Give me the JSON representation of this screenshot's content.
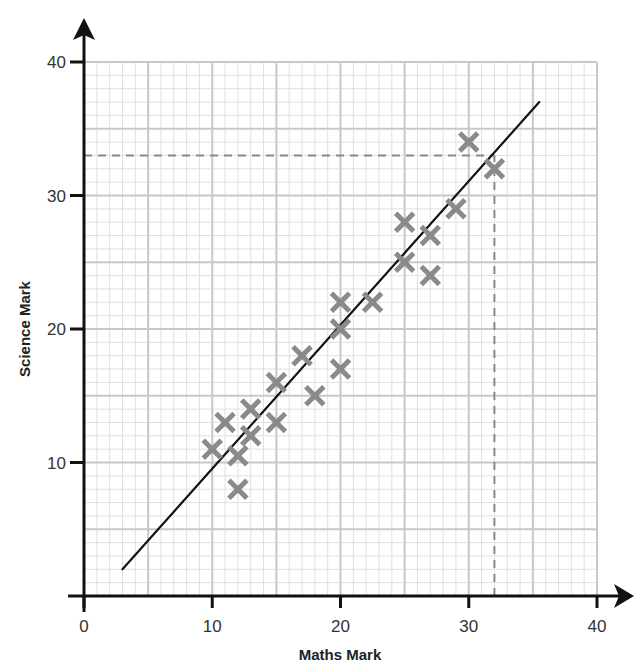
{
  "chart_data": {
    "type": "scatter",
    "title": "",
    "xlabel": "Maths Mark",
    "ylabel": "Science Mark",
    "xlim": [
      0,
      40
    ],
    "ylim": [
      0,
      40
    ],
    "x_ticks": [
      0,
      10,
      20,
      30,
      40
    ],
    "y_ticks": [
      10,
      20,
      30,
      40
    ],
    "x_tick_labels": [
      "0",
      "10",
      "20",
      "30",
      "40"
    ],
    "y_tick_labels": [
      "10",
      "20",
      "30",
      "40"
    ],
    "grid": {
      "major_step": 5,
      "minor_step": 1,
      "on": true
    },
    "legend": null,
    "marker": "x",
    "series": [
      {
        "name": "Students",
        "points": [
          [
            10,
            11
          ],
          [
            11,
            13
          ],
          [
            12,
            10.5
          ],
          [
            12,
            8
          ],
          [
            13,
            14
          ],
          [
            13,
            12
          ],
          [
            15,
            16
          ],
          [
            15,
            13
          ],
          [
            17,
            18
          ],
          [
            18,
            15
          ],
          [
            20,
            22
          ],
          [
            20,
            20
          ],
          [
            20,
            17
          ],
          [
            22.5,
            22
          ],
          [
            25,
            28
          ],
          [
            25,
            25
          ],
          [
            27,
            27
          ],
          [
            27,
            24
          ],
          [
            29,
            29
          ],
          [
            30,
            34
          ],
          [
            32,
            32
          ]
        ]
      }
    ],
    "line_of_best_fit": {
      "from": [
        3,
        2
      ],
      "to": [
        35.5,
        37
      ]
    },
    "annotations": [
      {
        "type": "dashed-horizontal",
        "y": 33,
        "x_from": 0,
        "x_to": 32
      },
      {
        "type": "dashed-vertical",
        "x": 32,
        "y_from": 0,
        "y_to": 33
      }
    ]
  },
  "colors": {
    "marker": "#8a8a8a",
    "grid_major": "#c8c8c8",
    "grid_minor": "#e0e0e0",
    "axis": "#111111",
    "fit_line": "#111111",
    "dashed": "#888888"
  }
}
